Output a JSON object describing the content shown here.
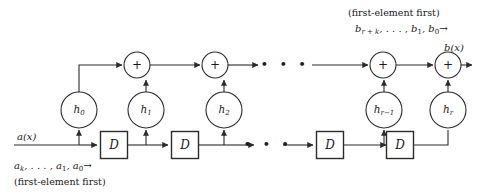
{
  "figure": {
    "stroke_color": "#2b2b2b",
    "text_color": "#1a1a1a",
    "background": "#ffffff"
  },
  "labels": {
    "output_stream_note": "(first-element first)",
    "output_stream": "b",
    "output_stream_sub_1": "r + k",
    "output_stream_mid": ", . . . , b",
    "output_stream_sub_2": "1",
    "output_stream_mid2": ", b",
    "output_stream_sub_3": "0",
    "output_arrow": "→",
    "output_signal": "b(x)",
    "input_signal": "a(x)",
    "input_stream": "a",
    "input_stream_sub_1": "k",
    "input_stream_mid": ", . . . , a",
    "input_stream_sub_2": "1",
    "input_stream_mid2": ", a",
    "input_stream_sub_3": "0",
    "input_arrow": "→",
    "input_stream_note": "(first-element first)"
  },
  "adders": [
    {
      "name": "adder-1",
      "symbol": "+",
      "cx": 137,
      "cy": 65
    },
    {
      "name": "adder-2",
      "symbol": "+",
      "cx": 215,
      "cy": 65
    },
    {
      "name": "adder-3",
      "symbol": "+",
      "cx": 383,
      "cy": 65
    },
    {
      "name": "adder-4",
      "symbol": "+",
      "cx": 448,
      "cy": 65
    }
  ],
  "coefficients": [
    {
      "name": "coeff-h0",
      "symbol": "h",
      "sub": "0",
      "cx": 79,
      "cy": 110
    },
    {
      "name": "coeff-h1",
      "symbol": "h",
      "sub": "1",
      "cx": 146,
      "cy": 110
    },
    {
      "name": "coeff-h2",
      "symbol": "h",
      "sub": "2",
      "cx": 224,
      "cy": 110
    },
    {
      "name": "coeff-hr-1",
      "symbol": "h",
      "sub": "r−1",
      "cx": 384,
      "cy": 110
    },
    {
      "name": "coeff-hr",
      "symbol": "h",
      "sub": "r",
      "cx": 448,
      "cy": 110
    }
  ],
  "delays": [
    {
      "name": "delay-1",
      "symbol": "D",
      "cx": 114,
      "cy": 145
    },
    {
      "name": "delay-2",
      "symbol": "D",
      "cx": 185,
      "cy": 145
    },
    {
      "name": "delay-3",
      "symbol": "D",
      "cx": 330,
      "cy": 145
    },
    {
      "name": "delay-4",
      "symbol": "D",
      "cx": 400,
      "cy": 145
    }
  ],
  "ellipses": [
    {
      "name": "ellipsis-top",
      "glyph": "• • •",
      "cx": 285,
      "cy": 65
    },
    {
      "name": "ellipsis-bottom",
      "glyph": "• • •",
      "cx": 268,
      "cy": 145
    }
  ],
  "geometry": {
    "adder_radius": 13,
    "coeff_radius": 18,
    "delay_box_w": 27,
    "delay_box_h": 27,
    "top_rail_y": 65,
    "bottom_rail_y": 145,
    "rail_x_start": 14,
    "rail_x_end": 470
  }
}
